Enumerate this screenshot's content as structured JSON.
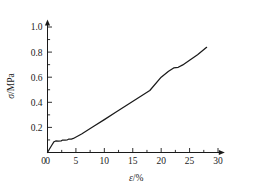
{
  "chart_data": {
    "type": "line",
    "title": "",
    "xlabel": "ε/%",
    "ylabel": "σ/MPa",
    "xlim": [
      0,
      31.2
    ],
    "ylim": [
      0,
      1.06
    ],
    "grid": false,
    "legend": null,
    "x_ticks": [
      0,
      5,
      10,
      15,
      20,
      25,
      30
    ],
    "x_tick_labels": [
      "0",
      "5",
      "10",
      "15",
      "20",
      "25",
      "30"
    ],
    "x_minor_ticks": [
      2.5,
      7.5,
      12.5,
      17.5,
      22.5,
      27.5
    ],
    "y_ticks": [
      0.2,
      0.4,
      0.6,
      0.8,
      1.0
    ],
    "y_tick_labels": [
      "0.2",
      "0.4",
      "0.6",
      "0.8",
      "1.0"
    ],
    "y_minor_ticks": [
      0.1,
      0.3,
      0.5,
      0.7,
      0.9
    ],
    "axis_arrows": true,
    "series": [
      {
        "name": "stress-strain",
        "color": "#1a1a1a",
        "x": [
          0.0,
          0.35,
          0.75,
          1.15,
          1.45,
          1.9,
          2.4,
          2.6,
          3.1,
          3.5,
          3.7,
          4.2,
          4.55,
          6.0,
          8.0,
          10.0,
          12.0,
          14.0,
          16.0,
          18.0,
          20.0,
          21.3,
          22.2,
          23.0,
          23.8,
          25.0,
          26.4,
          28.0
        ],
        "y": [
          0.0,
          0.028,
          0.058,
          0.086,
          0.092,
          0.091,
          0.093,
          0.098,
          0.099,
          0.101,
          0.106,
          0.107,
          0.112,
          0.148,
          0.205,
          0.262,
          0.32,
          0.378,
          0.436,
          0.494,
          0.6,
          0.648,
          0.674,
          0.679,
          0.698,
          0.735,
          0.779,
          0.838
        ]
      }
    ]
  },
  "axis_titles": {
    "y_symbol": "σ",
    "y_unit": "/MPa",
    "x_symbol": "ε",
    "x_unit": "/%"
  }
}
